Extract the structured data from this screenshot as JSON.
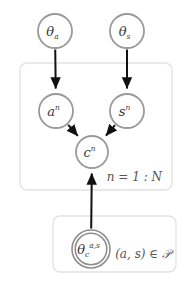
{
  "diagram": {
    "type": "plate-notation-graphical-model",
    "title": "",
    "background_color": "#ffffff",
    "node_stroke_color": "#9a9a9a",
    "node_fill_color": "#ffffff",
    "node_text_color": "#3a3a3a",
    "plate_stroke_color": "#e2e2e2",
    "edge_color": "#111111",
    "nodes": [
      {
        "id": "theta_a",
        "label_base": "θ",
        "label_sub": "a",
        "label_sup": "",
        "cx": 55,
        "cy": 31,
        "r": 17,
        "double": false,
        "plate": null
      },
      {
        "id": "theta_s",
        "label_base": "θ",
        "label_sub": "s",
        "label_sup": "",
        "cx": 127,
        "cy": 31,
        "r": 17,
        "double": false,
        "plate": null
      },
      {
        "id": "a_n",
        "label_base": "a",
        "label_sub": "",
        "label_sup": "n",
        "cx": 56,
        "cy": 111,
        "r": 17,
        "double": false,
        "plate": "plate_n"
      },
      {
        "id": "s_n",
        "label_base": "s",
        "label_sub": "",
        "label_sup": "n",
        "cx": 127,
        "cy": 111,
        "r": 17,
        "double": false,
        "plate": "plate_n"
      },
      {
        "id": "c_n",
        "label_base": "c",
        "label_sub": "",
        "label_sup": "n",
        "cx": 92,
        "cy": 152,
        "r": 16,
        "double": false,
        "plate": "plate_n"
      },
      {
        "id": "theta_c_as",
        "label_base": "θ",
        "label_sub": "c",
        "label_sup": "a,s",
        "cx": 91,
        "cy": 249,
        "r": 19,
        "double": true,
        "plate": "plate_p"
      }
    ],
    "edges": [
      {
        "from": "theta_a",
        "to": "a_n"
      },
      {
        "from": "theta_s",
        "to": "s_n"
      },
      {
        "from": "a_n",
        "to": "c_n"
      },
      {
        "from": "s_n",
        "to": "c_n"
      },
      {
        "from": "theta_c_as",
        "to": "c_n"
      }
    ],
    "plates": [
      {
        "id": "plate_n",
        "label": "n = 1 : N",
        "x": 20,
        "y": 63,
        "width": 152,
        "height": 127,
        "label_x": 162,
        "label_y": 181
      },
      {
        "id": "plate_p",
        "label": "(a, s) ∈ 𝒫",
        "x": 53,
        "y": 216,
        "width": 123,
        "height": 56,
        "label_x": 171,
        "label_y": 258
      }
    ]
  }
}
